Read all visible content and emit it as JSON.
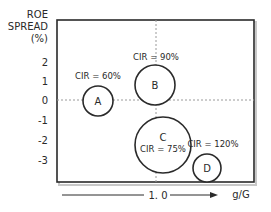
{
  "diagram": {
    "y_axis": {
      "label_lines": [
        "ROE",
        "SPREAD",
        "(%)"
      ],
      "ticks": [
        "2",
        "1",
        "0",
        "-1",
        "-2",
        "-3"
      ]
    },
    "x_axis": {
      "marker": "1. 0",
      "label": "g/G"
    },
    "bubbles": [
      {
        "id": "A",
        "cir_label": "CIR = 60%"
      },
      {
        "id": "B",
        "cir_label": "CIR = 90%"
      },
      {
        "id": "C",
        "cir_label": "CIR = 75%"
      },
      {
        "id": "D",
        "cir_label": "CIR = 120%"
      }
    ],
    "colors": {
      "line": "#2a2a2a",
      "dotted": "#9a9a9a",
      "shadow": "#bdbdbd"
    }
  }
}
